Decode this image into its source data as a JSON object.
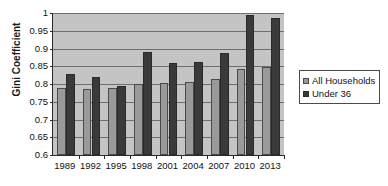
{
  "chart_data": {
    "type": "bar",
    "title": "",
    "xlabel": "",
    "ylabel": "Gini Coefficient",
    "ylim": [
      0.6,
      1
    ],
    "ytick_labels": [
      "1",
      "0.95",
      "0.9",
      "0.85",
      "0.8",
      "0.75",
      "0.7",
      "0.65",
      "0.6"
    ],
    "ytick_values": [
      1,
      0.95,
      0.9,
      0.85,
      0.8,
      0.75,
      0.7,
      0.65,
      0.6
    ],
    "grid": true,
    "legend_position": "right",
    "categories": [
      "1989",
      "1992",
      "1995",
      "1998",
      "2001",
      "2004",
      "2007",
      "2010",
      "2013"
    ],
    "series": [
      {
        "name": "All Households",
        "color": "#9a9a9a",
        "values": [
          0.789,
          0.786,
          0.789,
          0.799,
          0.803,
          0.806,
          0.814,
          0.843,
          0.849
        ]
      },
      {
        "name": "Under 36",
        "color": "#3a3a3a",
        "values": [
          0.828,
          0.821,
          0.795,
          0.889,
          0.858,
          0.861,
          0.888,
          0.995,
          0.985
        ]
      }
    ]
  },
  "legend": {
    "items": [
      {
        "label": "All Households"
      },
      {
        "label": "Under 36"
      }
    ]
  },
  "colors": {
    "plot_background": "#c4c4c4",
    "gridline": "#6e6e6e",
    "axis": "#2b2b2b",
    "series_all": "#9a9a9a",
    "series_under": "#3a3a3a"
  }
}
